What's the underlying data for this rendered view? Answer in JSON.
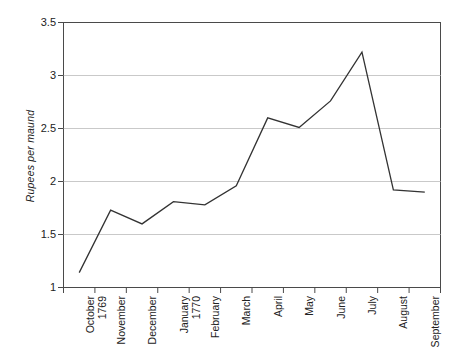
{
  "chart_data": {
    "type": "line",
    "title": "",
    "xlabel": "",
    "ylabel": "Rupees per maund",
    "ylim": [
      1,
      3.5
    ],
    "yticks": [
      "1",
      "1.5",
      "2",
      "2.5",
      "3",
      "3.5"
    ],
    "ytick_values": [
      1,
      1.5,
      2,
      2.5,
      3,
      3.5
    ],
    "grid": true,
    "legend": false,
    "categories": [
      "October 1769",
      "November",
      "December",
      "January 1770",
      "February",
      "March",
      "April",
      "May",
      "June",
      "July",
      "August",
      "September"
    ],
    "category_lines": [
      [
        "October",
        "1769"
      ],
      [
        "November",
        ""
      ],
      [
        "December",
        ""
      ],
      [
        "January",
        "1770"
      ],
      [
        "February",
        ""
      ],
      [
        "March",
        ""
      ],
      [
        "April",
        ""
      ],
      [
        "May",
        ""
      ],
      [
        "June",
        ""
      ],
      [
        "July",
        ""
      ],
      [
        "August",
        ""
      ],
      [
        "September",
        ""
      ]
    ],
    "values": [
      1.14,
      1.73,
      1.6,
      1.81,
      1.78,
      1.96,
      2.6,
      2.51,
      2.76,
      3.22,
      1.92,
      1.9
    ],
    "series": [
      {
        "name": "Rupees per maund",
        "values": [
          1.14,
          1.73,
          1.6,
          1.81,
          1.78,
          1.96,
          2.6,
          2.51,
          2.76,
          3.22,
          1.92,
          1.9
        ]
      }
    ],
    "line_color": "#333333",
    "grid_color": "#c9c9c9",
    "axis_color": "#4a4a4a",
    "background": "#ffffff"
  }
}
